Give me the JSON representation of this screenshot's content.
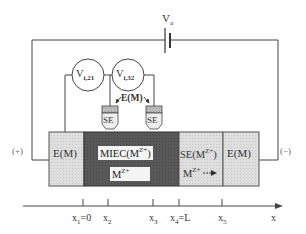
{
  "diagram": {
    "type": "electrochemical cell schematic",
    "battery": {
      "label": "V",
      "label_sub": "a"
    },
    "voltmeters": [
      {
        "label": "V",
        "label_sub": "i,21"
      },
      {
        "label": "V",
        "label_sub": "i,32"
      }
    ],
    "probe_label": "E(M)",
    "probes": [
      {
        "label": "SE"
      },
      {
        "label": "SE"
      }
    ],
    "terminals": {
      "positive": "(+)",
      "negative": "(−)"
    },
    "regions": [
      {
        "id": "electrode-left",
        "label": "E(M)",
        "fill": "#dcdcdc"
      },
      {
        "id": "miec",
        "label": "MIEC(M",
        "label_sup": "Z+",
        "label_close": ")",
        "flux": "M",
        "flux_sup": "Z+",
        "fill": "#555555"
      },
      {
        "id": "solid-electrolyte",
        "label": "SE(M",
        "label_sup": "Z+",
        "label_close": ")",
        "flux": "M",
        "flux_sup": "Z+",
        "fill": "#d6d6d6"
      },
      {
        "id": "electrode-right",
        "label": "E(M)",
        "fill": "#dcdcdc"
      }
    ],
    "axis": {
      "label": "x",
      "ticks": [
        {
          "main": "x",
          "sub": "1",
          "suffix": "=0"
        },
        {
          "main": "x",
          "sub": "2",
          "suffix": ""
        },
        {
          "main": "x",
          "sub": "3",
          "suffix": ""
        },
        {
          "main": "x",
          "sub": "4",
          "suffix": "=L"
        },
        {
          "main": "x",
          "sub": "5",
          "suffix": ""
        }
      ]
    }
  }
}
